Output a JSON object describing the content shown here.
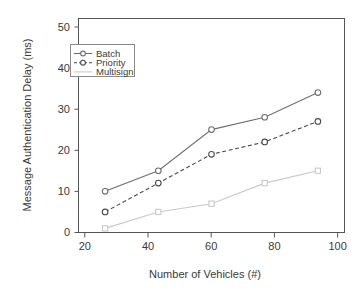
{
  "chart_data": {
    "type": "line",
    "title": "",
    "xlabel": "Number of Vehicles (#)",
    "ylabel": "Message Authentication Delay (ms)",
    "categories": [
      20,
      40,
      60,
      80,
      100
    ],
    "x": [
      20,
      40,
      60,
      80,
      100
    ],
    "xlim": [
      10,
      110
    ],
    "ylim": [
      0,
      52
    ],
    "xticks": [
      "20",
      "40",
      "60",
      "80",
      "100"
    ],
    "yticks": [
      "0",
      "10",
      "20",
      "30",
      "40",
      "50"
    ],
    "grid": false,
    "legend_position": "top-left",
    "series": [
      {
        "name": "Batch",
        "values": [
          10,
          15,
          25,
          28,
          34
        ],
        "color": "#6e6e6e",
        "line_style": "solid",
        "marker": "circle"
      },
      {
        "name": "Priority",
        "values": [
          5,
          12,
          19,
          22,
          27
        ],
        "color": "#4a4a4a",
        "line_style": "dashed",
        "marker": "circle"
      },
      {
        "name": "Multisign",
        "values": [
          1,
          5,
          7,
          12,
          15
        ],
        "color": "#c9c9c9",
        "line_style": "solid",
        "marker": "square"
      }
    ]
  },
  "axes": {
    "x_title": "Number of Vehicles (#)",
    "y_title": "Message Authentication Delay (ms)",
    "x_tick_labels": [
      "20",
      "40",
      "60",
      "80",
      "100"
    ],
    "y_tick_labels": [
      "0",
      "10",
      "20",
      "30",
      "40",
      "50"
    ]
  },
  "legend": {
    "entries": [
      {
        "label": "Batch"
      },
      {
        "label": "Priority"
      },
      {
        "label": "Multisign"
      }
    ]
  },
  "colors": {
    "axis": "#555555",
    "text": "#3a3a3a",
    "batch": "#6e6e6e",
    "priority": "#4a4a4a",
    "multisign": "#c9c9c9",
    "background": "#ffffff"
  }
}
